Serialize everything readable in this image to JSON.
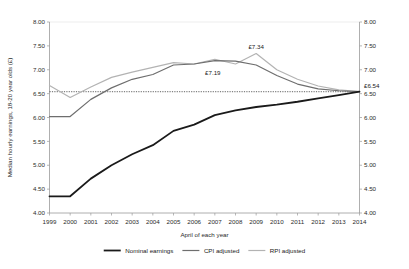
{
  "chart_data": {
    "type": "line",
    "title": "",
    "xlabel": "April of each year",
    "ylabel": "Median hourly earnings, 18-20 year olds (£)",
    "xlim": [
      1999,
      2014
    ],
    "ylim": [
      4.0,
      8.0
    ],
    "ytick_step": 0.5,
    "grid": false,
    "legend_position": "bottom",
    "x": [
      1999,
      2000,
      2001,
      2002,
      2003,
      2004,
      2005,
      2006,
      2007,
      2008,
      2009,
      2010,
      2011,
      2012,
      2013,
      2014
    ],
    "categories": [
      "1999",
      "2000",
      "2001",
      "2002",
      "2003",
      "2004",
      "2005",
      "2006",
      "2007",
      "2008",
      "2009",
      "2010",
      "2011",
      "2012",
      "2013",
      "2014"
    ],
    "ytick_labels": [
      "4.00",
      "4.50",
      "5.00",
      "5.50",
      "6.00",
      "6.50",
      "7.00",
      "7.50",
      "8.00"
    ],
    "ytick_values": [
      4.0,
      4.5,
      5.0,
      5.5,
      6.0,
      6.5,
      7.0,
      7.5,
      8.0
    ],
    "right_axis_labels": [
      "4.00",
      "4.50",
      "5.00",
      "5.50",
      "6.00",
      "6.50",
      "7.00",
      "7.50",
      "8.00"
    ],
    "reference_line": {
      "value": 6.54,
      "label": "£6.54",
      "style": "dotted"
    },
    "series": [
      {
        "name": "Nominal earnings",
        "color": "#1a1a1a",
        "width": 1.8,
        "values": [
          4.35,
          4.35,
          4.72,
          5.0,
          5.23,
          5.42,
          5.72,
          5.85,
          6.05,
          6.15,
          6.22,
          6.27,
          6.33,
          6.4,
          6.47,
          6.54
        ]
      },
      {
        "name": "CPI adjusted",
        "color": "#6e6e6e",
        "width": 1.2,
        "values": [
          6.02,
          6.02,
          6.38,
          6.62,
          6.8,
          6.9,
          7.1,
          7.12,
          7.19,
          7.18,
          7.1,
          6.88,
          6.7,
          6.6,
          6.56,
          6.54
        ]
      },
      {
        "name": "RPI adjusted",
        "color": "#b3b3b3",
        "width": 1.2,
        "values": [
          6.67,
          6.42,
          6.64,
          6.84,
          6.95,
          7.05,
          7.15,
          7.12,
          7.22,
          7.12,
          7.34,
          7.0,
          6.8,
          6.66,
          6.58,
          6.54
        ]
      }
    ],
    "annotations": [
      {
        "text": "£7.19",
        "x": 2007,
        "y": 7.19,
        "dx": -2,
        "dy": 14,
        "anchor": "middle"
      },
      {
        "text": "£7.34",
        "x": 2009,
        "y": 7.34,
        "dx": 0,
        "dy": -5,
        "anchor": "middle"
      }
    ]
  }
}
